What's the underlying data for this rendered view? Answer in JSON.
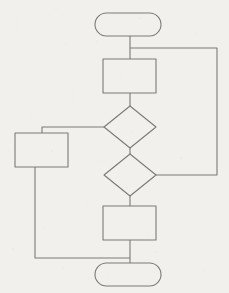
{
  "diagram": {
    "type": "flowchart",
    "style": {
      "background_color": "#f2f0ec",
      "stroke_color": "#7d7a76",
      "stroke_width": 1.1,
      "fill_color": "none",
      "has_text_labels": false,
      "has_arrowheads": false
    },
    "canvas": {
      "width": 229,
      "height": 293
    },
    "nodes": [
      {
        "id": "start",
        "shape": "terminal",
        "label": "",
        "x": 95,
        "y": 13,
        "width": 66,
        "height": 23,
        "radius": 11.5
      },
      {
        "id": "process-1",
        "shape": "process",
        "label": "",
        "x": 103,
        "y": 59,
        "width": 53,
        "height": 34
      },
      {
        "id": "decision-1",
        "shape": "decision",
        "label": "",
        "cx": 130,
        "cy": 127,
        "half_width": 26,
        "half_height": 21
      },
      {
        "id": "process-left",
        "shape": "process",
        "label": "",
        "x": 15,
        "y": 133,
        "width": 53,
        "height": 34
      },
      {
        "id": "decision-2",
        "shape": "decision",
        "label": "",
        "cx": 130,
        "cy": 175,
        "half_width": 26,
        "half_height": 21
      },
      {
        "id": "process-2",
        "shape": "process",
        "label": "",
        "x": 103,
        "y": 206,
        "width": 53,
        "height": 34
      },
      {
        "id": "end",
        "shape": "terminal",
        "label": "",
        "x": 95,
        "y": 263,
        "width": 66,
        "height": 23,
        "radius": 11.5
      }
    ],
    "connectors": [
      {
        "id": "start-to-process-1",
        "from": "start",
        "to": "process-1",
        "label": "",
        "points": [
          [
            130,
            36
          ],
          [
            130,
            59
          ]
        ]
      },
      {
        "id": "process-1-to-decision-1",
        "from": "process-1",
        "to": "decision-1",
        "label": "",
        "points": [
          [
            130,
            93
          ],
          [
            130,
            106
          ]
        ]
      },
      {
        "id": "decision-1-to-decision-2",
        "from": "decision-1",
        "to": "decision-2",
        "label": "",
        "points": [
          [
            130,
            148
          ],
          [
            130,
            154
          ]
        ]
      },
      {
        "id": "decision-2-to-process-2",
        "from": "decision-2",
        "to": "process-2",
        "label": "",
        "points": [
          [
            130,
            196
          ],
          [
            130,
            206
          ]
        ]
      },
      {
        "id": "process-2-to-end",
        "from": "process-2",
        "to": "end",
        "label": "",
        "points": [
          [
            130,
            240
          ],
          [
            130,
            263
          ]
        ]
      },
      {
        "id": "decision-1-to-process-left",
        "from": "decision-1",
        "to": "process-left",
        "label": "",
        "points": [
          [
            104,
            127
          ],
          [
            42,
            127
          ],
          [
            42,
            133
          ]
        ]
      },
      {
        "id": "process-left-to-end",
        "from": "process-left",
        "to": "end",
        "label": "",
        "points": [
          [
            35,
            167
          ],
          [
            35,
            258
          ],
          [
            130,
            258
          ]
        ]
      },
      {
        "id": "start-branch-to-decision-2",
        "from": "start",
        "to": "decision-2",
        "label": "",
        "points": [
          [
            130,
            48
          ],
          [
            217,
            48
          ],
          [
            217,
            175
          ],
          [
            156,
            175
          ]
        ]
      }
    ]
  }
}
